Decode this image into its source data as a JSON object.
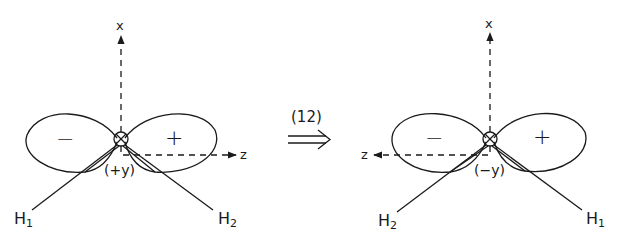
{
  "diagram": {
    "operation_label": "(12)",
    "operation_arrow": "⟹",
    "left_panel": {
      "axis_x_label": "x",
      "axis_z_label": "z",
      "axis_y_label": "(+y)",
      "lobe_left_sign": "−",
      "lobe_right_sign": "+",
      "h_left": {
        "base": "H",
        "sub": "1"
      },
      "h_right": {
        "base": "H",
        "sub": "2"
      }
    },
    "right_panel": {
      "axis_x_label": "x",
      "axis_z_label": "z",
      "axis_y_label": "(−y)",
      "lobe_left_sign": "−",
      "lobe_right_sign": "+",
      "h_left": {
        "base": "H",
        "sub": "2"
      },
      "h_right": {
        "base": "H",
        "sub": "1"
      }
    }
  }
}
